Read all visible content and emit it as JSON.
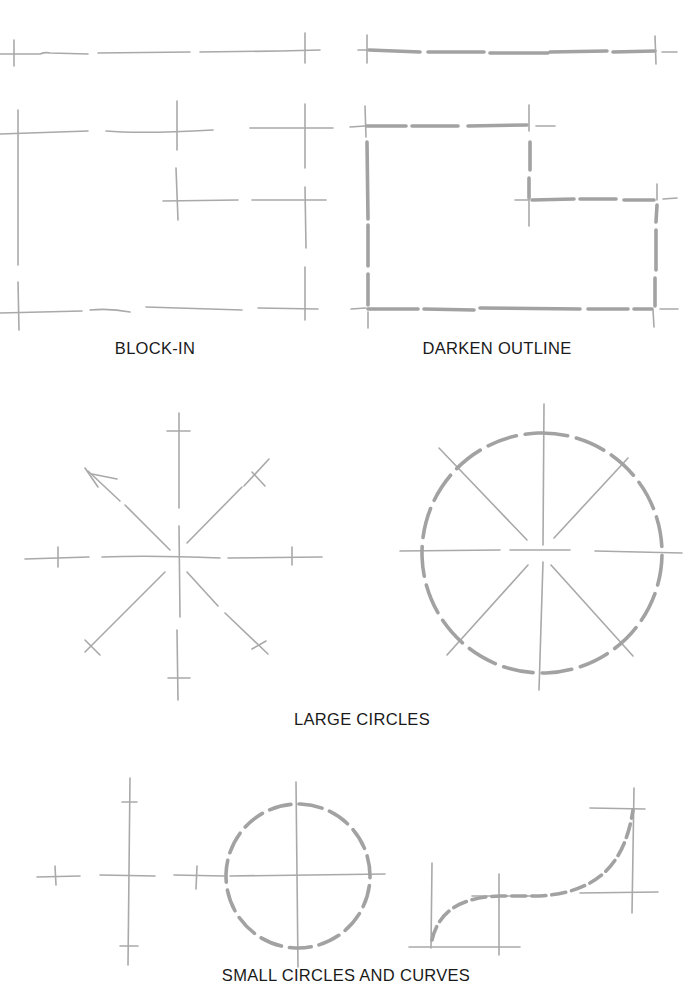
{
  "figure": {
    "panels": [
      {
        "id": "block-in",
        "caption": "BLOCK-IN"
      },
      {
        "id": "darken-outline",
        "caption": "DARKEN OUTLINE"
      },
      {
        "id": "large-circles",
        "caption": "LARGE CIRCLES"
      },
      {
        "id": "small-circles-and-curves",
        "caption": "SMALL CIRCLES AND CURVES"
      }
    ],
    "colors": {
      "light_line": "#a9a9a9",
      "dark_line": "#a2a2a2",
      "text": "#1a1a1a",
      "background": "#ffffff"
    }
  }
}
